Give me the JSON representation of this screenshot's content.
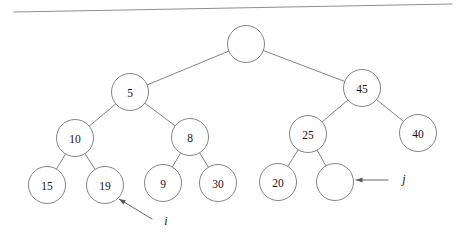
{
  "figure": {
    "kind": "binary-tree-diagram",
    "title": "",
    "background_color": "#ffffff",
    "stroke_color": "#6e6e74",
    "text_color": "#15151a",
    "pointer_color": "#55555c",
    "top_rule": {
      "name": "horizontal-rule",
      "x1": 14,
      "y1": 12,
      "x2": 452,
      "y2": 4,
      "color": "#8d8d93"
    },
    "node_radius": 18.5,
    "nodes": [
      {
        "id": "root",
        "label": "",
        "empty": true,
        "cx": 246,
        "cy": 44
      },
      {
        "id": "n5",
        "label": "5",
        "empty": false,
        "cx": 130,
        "cy": 92
      },
      {
        "id": "n45",
        "label": "45",
        "empty": false,
        "cx": 362,
        "cy": 88
      },
      {
        "id": "n10",
        "label": "10",
        "empty": false,
        "cx": 75,
        "cy": 138
      },
      {
        "id": "n8",
        "label": "8",
        "empty": false,
        "cx": 190,
        "cy": 137
      },
      {
        "id": "n25",
        "label": "25",
        "empty": false,
        "cx": 308,
        "cy": 134
      },
      {
        "id": "n40",
        "label": "40",
        "empty": false,
        "cx": 418,
        "cy": 133
      },
      {
        "id": "n15",
        "label": "15",
        "empty": false,
        "cx": 47,
        "cy": 185
      },
      {
        "id": "n19",
        "label": "19",
        "empty": false,
        "cx": 105,
        "cy": 185
      },
      {
        "id": "n9",
        "label": "9",
        "empty": false,
        "cx": 163,
        "cy": 183
      },
      {
        "id": "n30",
        "label": "30",
        "empty": false,
        "cx": 218,
        "cy": 183
      },
      {
        "id": "n20",
        "label": "20",
        "empty": false,
        "cx": 278,
        "cy": 182
      },
      {
        "id": "nempty",
        "label": "",
        "empty": true,
        "cx": 335,
        "cy": 182
      }
    ],
    "edges": [
      {
        "from": "root",
        "to": "n5"
      },
      {
        "from": "root",
        "to": "n45"
      },
      {
        "from": "n5",
        "to": "n10"
      },
      {
        "from": "n5",
        "to": "n8"
      },
      {
        "from": "n45",
        "to": "n25"
      },
      {
        "from": "n45",
        "to": "n40"
      },
      {
        "from": "n10",
        "to": "n15"
      },
      {
        "from": "n10",
        "to": "n19"
      },
      {
        "from": "n8",
        "to": "n9"
      },
      {
        "from": "n8",
        "to": "n30"
      },
      {
        "from": "n25",
        "to": "n20"
      },
      {
        "from": "n25",
        "to": "nempty"
      }
    ],
    "pointers": [
      {
        "id": "ptr-i",
        "label": "i",
        "target": "n19",
        "line": {
          "x1": 152,
          "y1": 219,
          "x2": 119,
          "y2": 199
        },
        "label_pos": {
          "x": 166,
          "y": 221
        }
      },
      {
        "id": "ptr-j",
        "label": "j",
        "target": "nempty",
        "line": {
          "x1": 388,
          "y1": 180,
          "x2": 356,
          "y2": 180
        },
        "label_pos": {
          "x": 404,
          "y": 179
        }
      }
    ]
  }
}
